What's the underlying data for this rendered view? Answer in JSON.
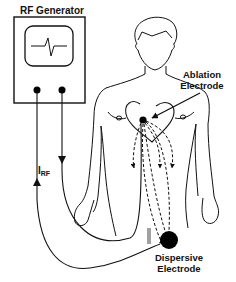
{
  "diagram": {
    "type": "medical-schematic",
    "labels": {
      "generator": "RF Generator",
      "ablation_line1": "Ablation",
      "ablation_line2": "Electrode",
      "dispersive_line1": "Dispersive",
      "dispersive_line2": "Electrode",
      "current_symbol": "I",
      "current_subscript": "RF"
    },
    "components": [
      {
        "id": "rf-generator",
        "shape": "box-with-ecg-screen",
        "terminals": 2
      },
      {
        "id": "human-body",
        "shape": "outline-figure"
      },
      {
        "id": "heart",
        "shape": "heart-outline"
      },
      {
        "id": "ablation-electrode",
        "shape": "filled-dot",
        "location": "inside heart"
      },
      {
        "id": "dispersive-electrode",
        "shape": "large-filled-circle",
        "location": "lower abdomen/thigh"
      },
      {
        "id": "current-paths",
        "shape": "dashed-arrows",
        "count": 4,
        "from": "ablation-electrode",
        "to": "dispersive-electrode"
      }
    ],
    "colors": {
      "stroke": "#111111",
      "fill": "#000000",
      "background": "#ffffff"
    }
  }
}
